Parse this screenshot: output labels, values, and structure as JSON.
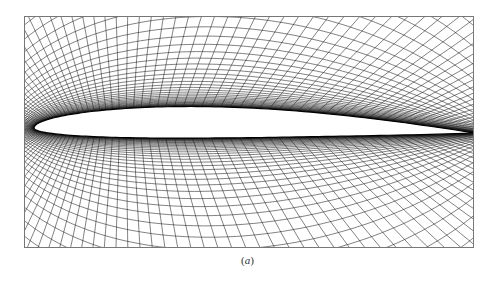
{
  "figure": {
    "caption_label": "a",
    "caption_open": "(",
    "caption_close": ")",
    "panel": {
      "description": "Body-fitted structured C/O-type computational mesh around an airfoil",
      "line_color": "#1a1a1a",
      "frame_color": "#777777",
      "background": "#ffffff",
      "airfoil_fill": "#ffffff"
    }
  }
}
